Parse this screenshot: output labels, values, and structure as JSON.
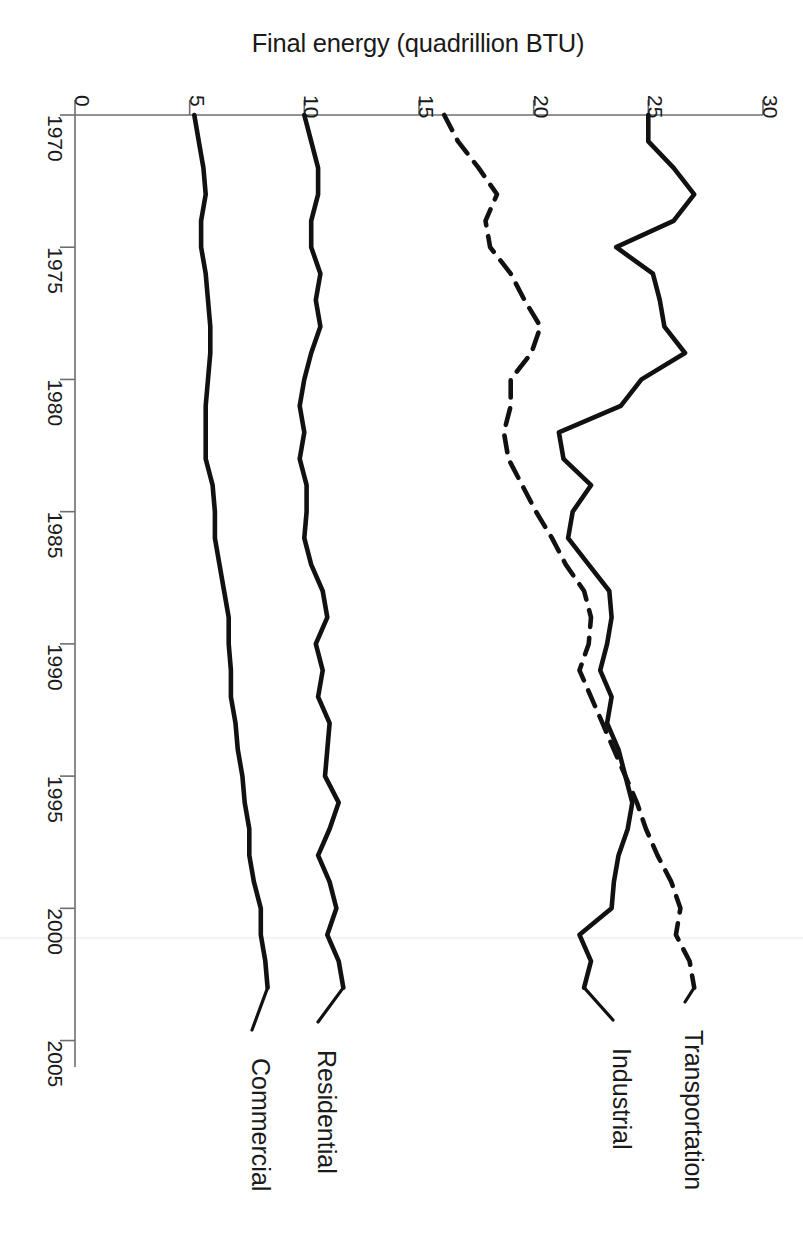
{
  "figure": {
    "orientation": "rotated-90-clockwise",
    "background_color": "#ffffff",
    "line_color": "#111111",
    "axis_color": "#6e6e6e"
  },
  "chart_data": {
    "type": "line",
    "title": "Final energy (quadrillion BTU)",
    "xlabel": "",
    "ylabel": "Final energy (quadrillion BTU)",
    "xlim": [
      1970,
      2006
    ],
    "ylim": [
      0,
      30
    ],
    "grid": false,
    "legend_position": "inline-end-labels",
    "x_tick_labels": [
      "1970",
      "1975",
      "1980",
      "1985",
      "1990",
      "1995",
      "2000",
      "2005"
    ],
    "x_ticks": [
      1970,
      1975,
      1980,
      1985,
      1990,
      1995,
      2000,
      2005
    ],
    "y_tick_labels": [
      "0",
      "5",
      "10",
      "15",
      "20",
      "25",
      "30"
    ],
    "y_ticks": [
      0,
      5,
      10,
      15,
      20,
      25,
      30
    ],
    "x": [
      1970,
      1971,
      1972,
      1973,
      1974,
      1975,
      1976,
      1977,
      1978,
      1979,
      1980,
      1981,
      1982,
      1983,
      1984,
      1985,
      1986,
      1987,
      1988,
      1989,
      1990,
      1991,
      1992,
      1993,
      1994,
      1995,
      1996,
      1997,
      1998,
      1999,
      2000,
      2001,
      2002,
      2003
    ],
    "series": [
      {
        "name": "Commercial",
        "style": "solid",
        "values": [
          5.2,
          5.4,
          5.6,
          5.7,
          5.5,
          5.5,
          5.7,
          5.8,
          5.9,
          5.9,
          5.8,
          5.7,
          5.7,
          5.7,
          6.0,
          6.1,
          6.1,
          6.3,
          6.5,
          6.7,
          6.7,
          6.8,
          6.8,
          7.0,
          7.1,
          7.3,
          7.4,
          7.6,
          7.6,
          7.8,
          8.1,
          8.1,
          8.3,
          8.4
        ]
      },
      {
        "name": "Residential",
        "style": "solid",
        "values": [
          10.0,
          10.3,
          10.6,
          10.6,
          10.3,
          10.3,
          10.7,
          10.5,
          10.7,
          10.3,
          10.0,
          9.8,
          10.0,
          9.8,
          10.1,
          10.1,
          10.0,
          10.3,
          10.8,
          11.0,
          10.5,
          10.8,
          10.6,
          11.1,
          11.0,
          10.9,
          11.5,
          11.1,
          10.6,
          11.1,
          11.4,
          11.0,
          11.5,
          11.7
        ]
      },
      {
        "name": "Industrial",
        "style": "solid",
        "values": [
          25.0,
          25.0,
          26.1,
          27.0,
          26.1,
          23.6,
          25.2,
          25.5,
          25.7,
          26.6,
          24.7,
          23.8,
          21.1,
          21.3,
          22.5,
          21.7,
          21.5,
          22.4,
          23.3,
          23.4,
          23.2,
          22.9,
          23.4,
          23.2,
          23.7,
          24.0,
          24.3,
          24.1,
          23.7,
          23.5,
          23.4,
          22.0,
          22.5,
          22.2
        ]
      },
      {
        "name": "Transportation",
        "style": "dashed",
        "values": [
          16.1,
          16.7,
          17.6,
          18.4,
          17.9,
          18.1,
          19.0,
          19.6,
          20.3,
          19.9,
          19.0,
          19.0,
          18.7,
          18.9,
          19.5,
          20.1,
          20.8,
          21.4,
          22.2,
          22.5,
          22.4,
          22.0,
          22.5,
          23.0,
          23.5,
          24.0,
          24.5,
          24.9,
          25.4,
          26.0,
          26.4,
          26.2,
          26.8,
          27.0
        ]
      }
    ]
  },
  "series_labels": [
    {
      "text": "Commercial"
    },
    {
      "text": "Residential"
    },
    {
      "text": "Industrial"
    },
    {
      "text": "Transportation"
    }
  ]
}
